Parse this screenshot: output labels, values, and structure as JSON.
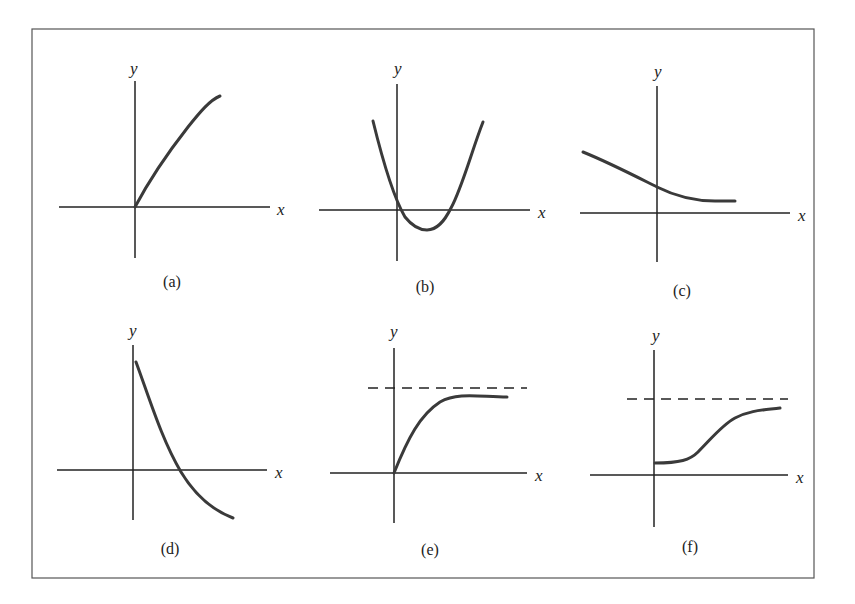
{
  "figure": {
    "frame": {
      "x": 32,
      "y": 29,
      "width": 782,
      "height": 549
    },
    "panels": [
      {
        "id": "a",
        "label": "(a)",
        "x_label": "x",
        "y_label": "y",
        "description": "Increasing concave-down curve starting at origin",
        "origin": [
          135,
          207
        ],
        "x_axis": [
          59,
          270
        ],
        "y_axis": [
          81,
          258
        ],
        "x_label_pos": [
          277,
          215
        ],
        "y_label_pos": [
          130,
          74
        ],
        "label_pos": [
          172,
          287
        ],
        "curve": "M135,207 C152,175 170,150 188,127 C200,112 210,100 220,96",
        "asymptote": null
      },
      {
        "id": "b",
        "label": "(b)",
        "x_label": "x",
        "y_label": "y",
        "description": "Upward-opening parabola with vertex below x-axis and two positive-side roots",
        "origin": [
          397,
          210
        ],
        "x_axis": [
          319,
          530
        ],
        "y_axis": [
          84,
          261
        ],
        "x_label_pos": [
          538,
          218
        ],
        "y_label_pos": [
          394,
          74
        ],
        "label_pos": [
          425,
          292
        ],
        "curve": "M373,121 C385,170 395,200 405,217 C413,227 420,230 427,230 C437,230 444,222 451,208 C462,188 472,150 483,122",
        "asymptote": null
      },
      {
        "id": "c",
        "label": "(c)",
        "x_label": "x",
        "y_label": "y",
        "description": "Decreasing curve leveling off above x-axis",
        "origin": [
          657,
          213
        ],
        "x_axis": [
          580,
          790
        ],
        "y_axis": [
          86,
          262
        ],
        "x_label_pos": [
          798,
          221
        ],
        "y_label_pos": [
          654,
          77
        ],
        "label_pos": [
          682,
          296
        ],
        "curve": "M583,152 C610,163 635,176 657,187 C675,196 695,201 715,201 L735,201",
        "asymptote": null
      },
      {
        "id": "d",
        "label": "(d)",
        "x_label": "x",
        "y_label": "y",
        "description": "Decreasing concave-up curve from positive y-intercept crossing x-axis and going negative",
        "origin": [
          133,
          470
        ],
        "x_axis": [
          57,
          267
        ],
        "y_axis": [
          345,
          520
        ],
        "x_label_pos": [
          275,
          478
        ],
        "y_label_pos": [
          129,
          336
        ],
        "label_pos": [
          170,
          554
        ],
        "curve": "M136,362 C150,400 162,440 181,472 C195,495 212,510 233,518",
        "asymptote": null
      },
      {
        "id": "e",
        "label": "(e)",
        "x_label": "x",
        "y_label": "y",
        "description": "Increasing curve from origin approaching a horizontal asymptote (dashed)",
        "origin": [
          394,
          473
        ],
        "x_axis": [
          330,
          527
        ],
        "y_axis": [
          348,
          523
        ],
        "x_label_pos": [
          535,
          481
        ],
        "y_label_pos": [
          390,
          337
        ],
        "label_pos": [
          430,
          555
        ],
        "curve": "M394,473 C408,438 420,415 440,402 C458,392 480,397 507,397",
        "asymptote": {
          "y": 388,
          "x1": 368,
          "x2": 527
        }
      },
      {
        "id": "f",
        "label": "(f)",
        "x_label": "x",
        "y_label": "y",
        "description": "S-shaped (logistic) increasing curve from positive y-intercept approaching a horizontal asymptote (dashed)",
        "origin": [
          654,
          475
        ],
        "x_axis": [
          590,
          788
        ],
        "y_axis": [
          350,
          527
        ],
        "x_label_pos": [
          796,
          483
        ],
        "y_label_pos": [
          652,
          341
        ],
        "label_pos": [
          690,
          552
        ],
        "curve": "M655,463 C680,463 690,460 698,452 C712,438 722,425 735,418 C750,410 765,410 780,408",
        "asymptote": {
          "y": 399,
          "x1": 627,
          "x2": 788
        }
      }
    ]
  },
  "chart_data": [
    {
      "type": "line",
      "panel": "(a)",
      "title": "(a)",
      "xlabel": "x",
      "ylabel": "y",
      "shape": "increasing, concave down, starts at origin",
      "y_intercept": "0",
      "asymptote": "none",
      "grid": false,
      "legend": "none"
    },
    {
      "type": "line",
      "panel": "(b)",
      "title": "(b)",
      "xlabel": "x",
      "ylabel": "y",
      "shape": "parabola opening upward, minimum below x-axis",
      "y_intercept": "positive (small)",
      "roots": "two, both near/positive x",
      "asymptote": "none",
      "grid": false,
      "legend": "none"
    },
    {
      "type": "line",
      "panel": "(c)",
      "title": "(c)",
      "xlabel": "x",
      "ylabel": "y",
      "shape": "decreasing, leveling off above x-axis",
      "y_intercept": "positive",
      "asymptote": "none drawn",
      "grid": false,
      "legend": "none"
    },
    {
      "type": "line",
      "panel": "(d)",
      "title": "(d)",
      "xlabel": "x",
      "ylabel": "y",
      "shape": "decreasing, concave up, crosses x-axis",
      "y_intercept": "positive (large)",
      "asymptote": "none",
      "grid": false,
      "legend": "none"
    },
    {
      "type": "line",
      "panel": "(e)",
      "title": "(e)",
      "xlabel": "x",
      "ylabel": "y",
      "shape": "increasing from origin, concave down, approaches horizontal asymptote",
      "y_intercept": "0",
      "asymptote": "dashed horizontal line above curve",
      "grid": false,
      "legend": "none"
    },
    {
      "type": "line",
      "panel": "(f)",
      "title": "(f)",
      "xlabel": "x",
      "ylabel": "y",
      "shape": "S-shaped (logistic) increasing, approaches horizontal asymptote",
      "y_intercept": "positive (small)",
      "asymptote": "dashed horizontal line above curve",
      "grid": false,
      "legend": "none"
    }
  ]
}
